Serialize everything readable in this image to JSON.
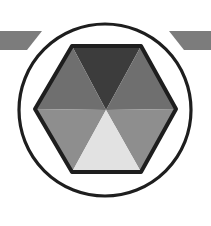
{
  "logo": {
    "name": "hexagon-in-circle-emblem",
    "colors": {
      "background": "#ffffff",
      "outline": "#1e1e1e",
      "bars": "#7c7c7c",
      "top_segment": "#3c3c3c",
      "upper_side_segments": "#6f6f6f",
      "lower_side_segments": "#8e8e8e",
      "bottom_segment": "#e2e2e2"
    }
  }
}
